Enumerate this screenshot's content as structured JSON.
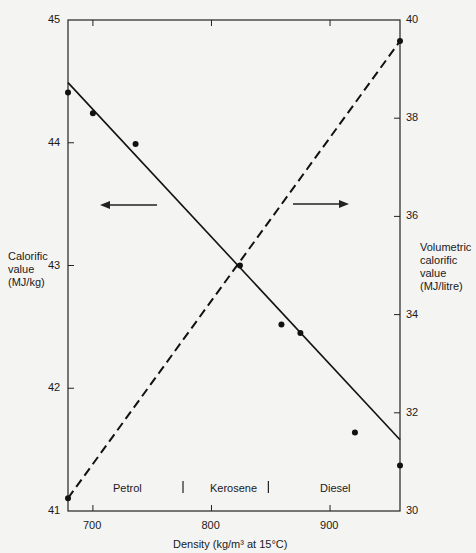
{
  "page": {
    "page_number": "96",
    "running_head": "ENERGY AND ENVIRONMENT IN THE WORLD"
  },
  "chart_data": {
    "type": "line",
    "title": "",
    "xlabel": "Density (kg/m³ at 15°C)",
    "ylabel_left": "Calorific value (MJ/kg)",
    "ylabel_right": "Volumetric calorific value (MJ/litre)",
    "xlim": [
      679,
      959
    ],
    "ylim_left": [
      41,
      45
    ],
    "ylim_right": [
      30,
      40
    ],
    "x_ticks": [
      700,
      800,
      900
    ],
    "y_left_ticks": [
      41,
      42,
      43,
      44,
      45
    ],
    "y_right_ticks": [
      30,
      32,
      34,
      36,
      38,
      40
    ],
    "grid": false,
    "legend": null,
    "fuel_regions": [
      {
        "label": "Petrol",
        "x_from": 679,
        "x_to": 776
      },
      {
        "label": "Kerosene",
        "x_from": 776,
        "x_to": 848
      },
      {
        "label": "Diesel",
        "x_from": 848,
        "x_to": 959
      }
    ],
    "series": [
      {
        "name": "Calorific value (MJ/kg)",
        "axis": "left",
        "style": "solid",
        "points": [
          {
            "x": 679,
            "y": 44.41
          },
          {
            "x": 700,
            "y": 44.24
          },
          {
            "x": 736,
            "y": 43.99
          },
          {
            "x": 824,
            "y": 43.0
          },
          {
            "x": 859,
            "y": 42.52
          },
          {
            "x": 875,
            "y": 42.45
          },
          {
            "x": 921,
            "y": 41.64
          },
          {
            "x": 959,
            "y": 41.37
          }
        ],
        "fit_line": {
          "x": [
            679,
            959
          ],
          "y": [
            44.49,
            41.58
          ]
        }
      },
      {
        "name": "Volumetric calorific value (MJ/litre)",
        "axis": "right",
        "style": "dashed",
        "points": [
          {
            "x": 679,
            "y": 30.26
          },
          {
            "x": 959,
            "y": 39.57
          }
        ],
        "fit_line": {
          "x": [
            679,
            959
          ],
          "y": [
            30.26,
            39.57
          ]
        }
      }
    ],
    "annotations": [
      {
        "type": "arrow",
        "direction": "left",
        "meaning": "solid line reads on left axis"
      },
      {
        "type": "arrow",
        "direction": "right",
        "meaning": "dashed line reads on right axis"
      }
    ]
  },
  "labels": {
    "left_axis": [
      "Calorific",
      "value",
      "(MJ/kg)"
    ],
    "right_axis": [
      "Volumetric",
      "calorific",
      "value",
      "(MJ/litre)"
    ],
    "x_axis": "Density (kg/m³ at 15°C)",
    "regions": [
      "Petrol",
      "Kerosene",
      "Diesel"
    ],
    "x_ticks": [
      "700",
      "800",
      "900"
    ],
    "y_left_ticks": [
      "41",
      "42",
      "43",
      "44",
      "45"
    ],
    "y_right_ticks": [
      "30",
      "32",
      "34",
      "36",
      "38",
      "40"
    ]
  }
}
